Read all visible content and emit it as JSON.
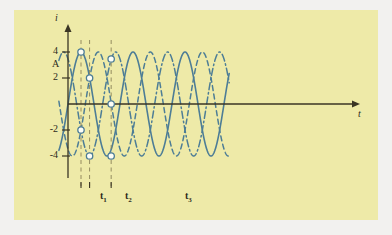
{
  "figure": {
    "background_color": "#f2f1ef",
    "panel_color": "#eeeaa8",
    "curve_color": "#4d7d96",
    "axis_color": "#3a3524",
    "marker_fill": "#fdfdf5"
  },
  "axes": {
    "y_axis_label": "i",
    "y_unit_label": "A",
    "x_axis_label": "t",
    "y_ticks": [
      "4",
      "2",
      "-2",
      "-4"
    ],
    "y_tick_values": [
      4,
      2,
      -2,
      -4
    ],
    "x_tick_labels": [
      "t",
      "t",
      "t"
    ],
    "x_tick_subscripts": [
      "1",
      "2",
      "3"
    ]
  },
  "chart_data": {
    "type": "line",
    "title": "",
    "xlabel": "t",
    "ylabel": "i",
    "yunit": "A",
    "ylim": [
      -4.6,
      4.6
    ],
    "xlim": [
      0,
      6.05
    ],
    "grid": false,
    "legend": false,
    "amplitude": 4,
    "period": 2.0,
    "series": [
      {
        "name": "phase-a",
        "style": "solid",
        "phase_deg": 0,
        "color": "#4d7d96",
        "formula": "i = 4 sin(2 pi t / 2.0)"
      },
      {
        "name": "phase-b",
        "style": "dash-dot",
        "phase_deg": 120,
        "color": "#4d7d96",
        "formula": "i = 4 sin(2 pi t / 2.0 + 120 deg)"
      },
      {
        "name": "phase-c",
        "style": "dashed",
        "phase_deg": 240,
        "color": "#4d7d96",
        "formula": "i = 4 sin(2 pi t / 2.0 + 240 deg)"
      }
    ],
    "markers": [
      {
        "at": "t1",
        "t": 0.5,
        "values": [
          4.0,
          -2.0,
          -2.0
        ]
      },
      {
        "at": "t2",
        "t": 0.83,
        "values": [
          2.0,
          2.0,
          -4.0
        ]
      },
      {
        "at": "t3",
        "t": 1.66,
        "values": [
          -4.0,
          3.46,
          0.0
        ]
      }
    ],
    "marker_points": [
      {
        "t": 0.5,
        "i": 4.0
      },
      {
        "t": 0.5,
        "i": -2.0
      },
      {
        "t": 0.83,
        "i": 2.0
      },
      {
        "t": 0.83,
        "i": -4.0
      },
      {
        "t": 1.66,
        "i": 3.46
      },
      {
        "t": 1.66,
        "i": 0.0
      },
      {
        "t": 1.66,
        "i": -4.0
      }
    ],
    "vertical_markers": [
      {
        "label": "t1",
        "t": 0.5
      },
      {
        "label": "t2",
        "t": 0.83
      },
      {
        "label": "t3",
        "t": 1.66
      }
    ]
  }
}
